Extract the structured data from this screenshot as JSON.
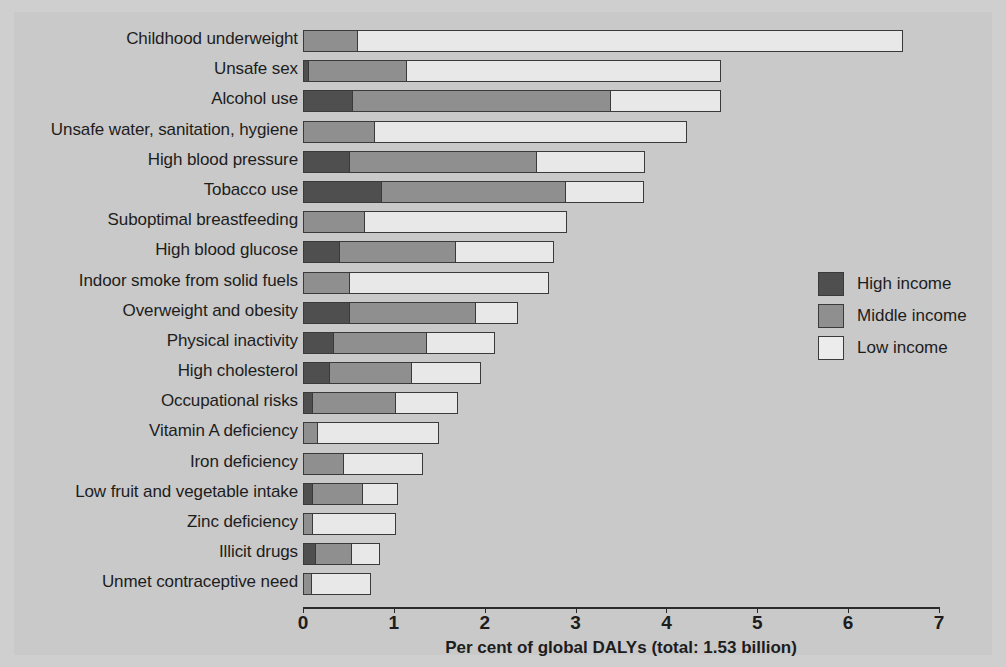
{
  "chart_data": {
    "type": "bar",
    "orientation": "horizontal",
    "stacked": true,
    "title": "",
    "xlabel": "Per cent of global DALYs (total: 1.53 billion)",
    "ylabel": "",
    "xlim": [
      0,
      7
    ],
    "xticks": [
      "0",
      "1",
      "2",
      "3",
      "4",
      "5",
      "6",
      "7"
    ],
    "grid": false,
    "legend_position": "right",
    "legend": [
      "High income",
      "Middle income",
      "Low income"
    ],
    "series": [
      {
        "name": "High income",
        "color": "#4f4f4f",
        "values": [
          0.0,
          0.07,
          0.55,
          0.0,
          0.52,
          0.87,
          0.0,
          0.41,
          0.0,
          0.52,
          0.34,
          0.3,
          0.11,
          0.0,
          0.0,
          0.11,
          0.0,
          0.14,
          0.0
        ]
      },
      {
        "name": "Middle income",
        "color": "#8f8f8f",
        "values": [
          0.6,
          1.09,
          2.85,
          0.79,
          2.07,
          2.04,
          0.68,
          1.29,
          0.52,
          1.4,
          1.04,
          0.91,
          0.93,
          0.16,
          0.45,
          0.56,
          0.11,
          0.41,
          0.1
        ]
      },
      {
        "name": "Low income",
        "color": "#ececec",
        "values": [
          6.02,
          3.46,
          1.22,
          3.45,
          1.2,
          0.86,
          2.24,
          1.08,
          2.2,
          0.47,
          0.76,
          0.77,
          0.69,
          1.35,
          0.88,
          0.4,
          0.92,
          0.32,
          0.66
        ]
      }
    ],
    "categories": [
      "Childhood underweight",
      "Unsafe sex",
      "Alcohol use",
      "Unsafe water, sanitation, hygiene",
      "High blood pressure",
      "Tobacco use",
      "Suboptimal breastfeeding",
      "High blood glucose",
      "Indoor smoke from solid fuels",
      "Overweight and obesity",
      "Physical inactivity",
      "High cholesterol",
      "Occupational risks",
      "Vitamin A deficiency",
      "Iron deficiency",
      "Low fruit and vegetable intake",
      "Zinc deficiency",
      "Illicit drugs",
      "Unmet contraceptive need"
    ],
    "totals": [
      6.62,
      4.62,
      4.62,
      4.24,
      3.79,
      3.77,
      2.92,
      2.78,
      2.72,
      2.39,
      2.14,
      1.98,
      1.73,
      1.51,
      1.33,
      1.07,
      1.03,
      0.87,
      0.76
    ]
  },
  "colors": {
    "high_income": "#4f4f4f",
    "middle_income": "#8f8f8f",
    "low_income": "#ececec",
    "panel_background": "#c9c9c9",
    "text": "#1d1d1d"
  }
}
